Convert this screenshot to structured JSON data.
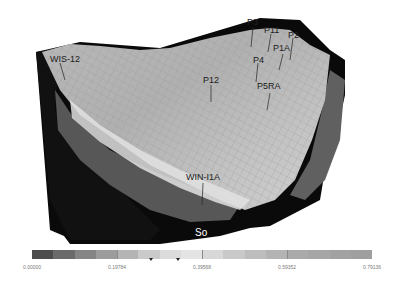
{
  "figure": {
    "type": "3D reservoir grid property view",
    "property_label": "So"
  },
  "wells": [
    {
      "name": "WIS-12"
    },
    {
      "name": "P3"
    },
    {
      "name": "P11"
    },
    {
      "name": "P2"
    },
    {
      "name": "P1A"
    },
    {
      "name": "P4"
    },
    {
      "name": "P5RA"
    },
    {
      "name": "P12"
    },
    {
      "name": "WIN-I1A"
    }
  ],
  "colorbar": {
    "min": 0.0,
    "max": 0.79136,
    "ticks": [
      "0.00000",
      "0.19784",
      "0.39568",
      "0.59352",
      "0.79136"
    ],
    "colors": [
      "#4d4d4d",
      "#6b6b6b",
      "#858585",
      "#9c9c9c",
      "#b4b4b4",
      "#cacaca",
      "#dcdcdc",
      "#e4e4e4",
      "#d8d8d8",
      "#c9c9c9",
      "#bdbdbd",
      "#b3b3b3",
      "#aaaaaa",
      "#a6a6a6",
      "#a2a2a2",
      "#9f9f9f"
    ],
    "markers": [
      0.35,
      0.43
    ]
  },
  "colors": {
    "base_black": "#0a0a0a",
    "dark_band": "#555555",
    "surface_mid": "#a9a9a9",
    "surface_light": "#d2d2d2"
  }
}
